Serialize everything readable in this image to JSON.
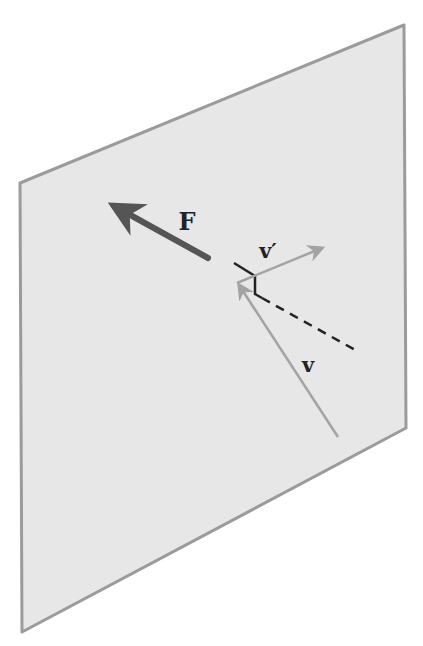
{
  "figure": {
    "type": "physics-collision-diagram",
    "colors": {
      "background": "#ffffff",
      "plane_fill": "#e7e7e7",
      "plane_edge": "#9b9b9b",
      "force_arrow": "#555555",
      "velocity_arrow": "#a3a3a3",
      "normal_marker": "#222222",
      "label": "#222222"
    },
    "plane": {
      "points": "20,183 404,25 406,428 22,632"
    },
    "vectors": {
      "force": {
        "label": "F",
        "from": [
          208,
          258
        ],
        "to": [
          114,
          206
        ],
        "label_pos": [
          187,
          230
        ]
      },
      "incoming_velocity": {
        "label": "v",
        "from": [
          338,
          437
        ],
        "to": [
          239,
          285
        ],
        "label_pos": [
          308,
          372
        ]
      },
      "outgoing_velocity": {
        "label": "v′",
        "from": [
          237,
          283
        ],
        "to": [
          322,
          248
        ],
        "label_pos": [
          268,
          258
        ]
      }
    },
    "normal_marker": {
      "surface_segment": [
        [
          234,
          263
        ],
        [
          255,
          276
        ]
      ],
      "right_angle_segment": [
        [
          255,
          276
        ],
        [
          255,
          294
        ],
        [
          262,
          298
        ]
      ],
      "dashed_normal": [
        [
          262,
          298
        ],
        [
          357,
          351
        ]
      ]
    }
  }
}
